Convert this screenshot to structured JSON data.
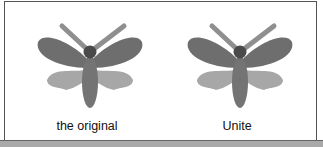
{
  "panels": [
    {
      "id": "original",
      "caption": "the original",
      "image": "moth-icon"
    },
    {
      "id": "unite",
      "caption": "Unite",
      "image": "moth-icon"
    }
  ],
  "colors": {
    "upper_wing": "#6e6e6e",
    "lower_wing": "#a7a7a7",
    "body": "#747474",
    "head": "#4a4a4a",
    "antenna": "#8f8f8f",
    "border": "#555555",
    "bottom_band": "#a9a9a9"
  }
}
